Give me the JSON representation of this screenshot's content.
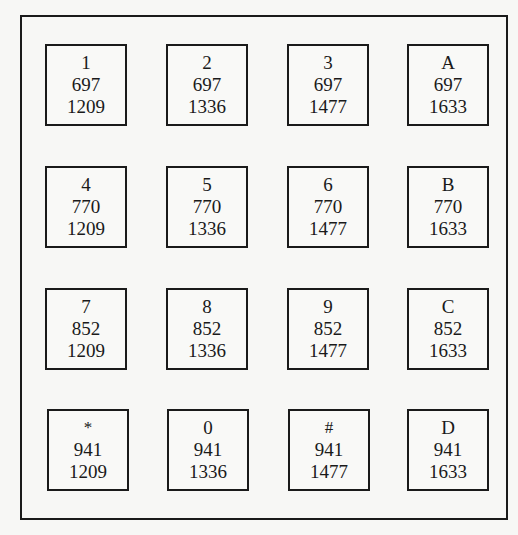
{
  "keypad": {
    "row_frequencies_hz": [
      697,
      770,
      852,
      941
    ],
    "column_frequencies_hz": [
      1209,
      1336,
      1477,
      1633
    ],
    "rows": [
      [
        {
          "symbol": "1",
          "low": "697",
          "high": "1209"
        },
        {
          "symbol": "2",
          "low": "697",
          "high": "1336"
        },
        {
          "symbol": "3",
          "low": "697",
          "high": "1477"
        },
        {
          "symbol": "A",
          "low": "697",
          "high": "1633"
        }
      ],
      [
        {
          "symbol": "4",
          "low": "770",
          "high": "1209"
        },
        {
          "symbol": "5",
          "low": "770",
          "high": "1336"
        },
        {
          "symbol": "6",
          "low": "770",
          "high": "1477"
        },
        {
          "symbol": "B",
          "low": "770",
          "high": "1633"
        }
      ],
      [
        {
          "symbol": "7",
          "low": "852",
          "high": "1209"
        },
        {
          "symbol": "8",
          "low": "852",
          "high": "1336"
        },
        {
          "symbol": "9",
          "low": "852",
          "high": "1477"
        },
        {
          "symbol": "C",
          "low": "852",
          "high": "1633"
        }
      ],
      [
        {
          "symbol": "*",
          "low": "941",
          "high": "1209"
        },
        {
          "symbol": "0",
          "low": "941",
          "high": "1336"
        },
        {
          "symbol": "#",
          "low": "941",
          "high": "1477"
        },
        {
          "symbol": "D",
          "low": "941",
          "high": "1633"
        }
      ]
    ]
  }
}
